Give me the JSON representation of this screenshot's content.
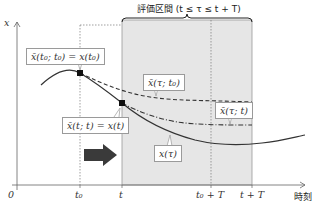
{
  "diagram": {
    "title": "評価区間 (t ≤ τ ≤ t + T)",
    "y_axis_label": "x",
    "x_axis_label": "時刻",
    "ticks": {
      "origin": "0",
      "t0": "t₀",
      "t": "t",
      "t0_plus_T": "t₀ + T",
      "t_plus_T": "t + T"
    },
    "labels": {
      "initial_condition_t0": "x̄(t₀; t₀) = x(t₀)",
      "initial_condition_t": "x̄(t; t) = x(t)",
      "prediction_from_t0": "x̄(τ; t₀)",
      "prediction_from_t": "x̄(τ; t)",
      "actual_trajectory": "x(τ)"
    },
    "colors": {
      "shaded_region": "#e6e6e6",
      "curve": "#333333",
      "arrow": "#3a3a3a",
      "label_border": "#9a9a9a"
    }
  }
}
